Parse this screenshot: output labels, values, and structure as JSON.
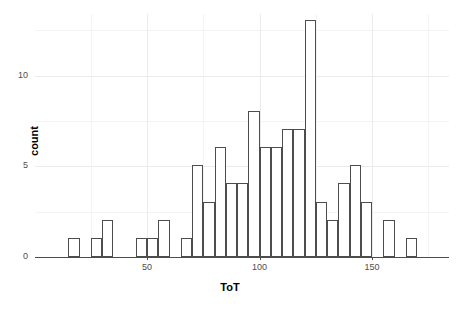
{
  "chart_data": {
    "type": "bar",
    "subtype": "histogram",
    "title": "",
    "xlabel": "ToT",
    "ylabel": "count",
    "binwidth": 5,
    "xlim": [
      14,
      177
    ],
    "ylim": [
      0,
      13
    ],
    "grid": true,
    "legend": null,
    "x_ticks": [
      50,
      100,
      150
    ],
    "x_tick_labels": [
      "50",
      "100",
      "150"
    ],
    "y_ticks": [
      0,
      5,
      10
    ],
    "y_tick_labels": [
      "0",
      "5",
      "10"
    ],
    "bar_fill": "#ffffff",
    "bar_stroke": "#4d4d4d",
    "panel_background": "#ffffff",
    "grid_color": "#ebebeb",
    "bins": [
      {
        "start": 15,
        "end": 20,
        "count": 1
      },
      {
        "start": 20,
        "end": 25,
        "count": 0
      },
      {
        "start": 25,
        "end": 30,
        "count": 1
      },
      {
        "start": 30,
        "end": 35,
        "count": 2
      },
      {
        "start": 35,
        "end": 40,
        "count": 0
      },
      {
        "start": 40,
        "end": 45,
        "count": 0
      },
      {
        "start": 45,
        "end": 50,
        "count": 1
      },
      {
        "start": 50,
        "end": 55,
        "count": 1
      },
      {
        "start": 55,
        "end": 60,
        "count": 2
      },
      {
        "start": 60,
        "end": 65,
        "count": 0
      },
      {
        "start": 65,
        "end": 70,
        "count": 1
      },
      {
        "start": 70,
        "end": 75,
        "count": 5
      },
      {
        "start": 75,
        "end": 80,
        "count": 3
      },
      {
        "start": 80,
        "end": 85,
        "count": 6
      },
      {
        "start": 85,
        "end": 90,
        "count": 4
      },
      {
        "start": 90,
        "end": 95,
        "count": 4
      },
      {
        "start": 95,
        "end": 100,
        "count": 8
      },
      {
        "start": 100,
        "end": 105,
        "count": 6
      },
      {
        "start": 105,
        "end": 110,
        "count": 6
      },
      {
        "start": 110,
        "end": 115,
        "count": 7
      },
      {
        "start": 115,
        "end": 120,
        "count": 7
      },
      {
        "start": 120,
        "end": 125,
        "count": 13
      },
      {
        "start": 125,
        "end": 130,
        "count": 3
      },
      {
        "start": 130,
        "end": 135,
        "count": 2
      },
      {
        "start": 135,
        "end": 140,
        "count": 4
      },
      {
        "start": 140,
        "end": 145,
        "count": 5
      },
      {
        "start": 145,
        "end": 150,
        "count": 3
      },
      {
        "start": 150,
        "end": 155,
        "count": 0
      },
      {
        "start": 155,
        "end": 160,
        "count": 2
      },
      {
        "start": 160,
        "end": 165,
        "count": 0
      },
      {
        "start": 165,
        "end": 170,
        "count": 1
      }
    ]
  }
}
